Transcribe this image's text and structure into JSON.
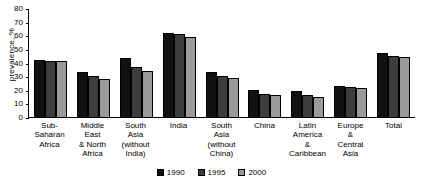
{
  "chart_data": {
    "type": "bar",
    "title": "",
    "xlabel": "",
    "ylabel": "prevalence, %",
    "ylim": [
      0,
      80
    ],
    "ytick_step": 10,
    "yticks": [
      80,
      70,
      60,
      50,
      40,
      30,
      20,
      10,
      0
    ],
    "grid": false,
    "legend_position": "bottom-center",
    "categories": [
      "Sub-Saharan\nAfrica",
      "Middle East\n& North\nAfrica",
      "South\nAsia\n(without\nIndia)",
      "India",
      "South\nAsia\n(without\nChina)",
      "China",
      "Latin\nAmerica\n&\nCaribbean",
      "Europe\n&\nCentral\nAsia",
      "Total"
    ],
    "series": [
      {
        "name": "1990",
        "color": "#111111",
        "values": [
          42,
          33,
          43,
          62,
          33,
          20,
          19,
          23,
          47
        ]
      },
      {
        "name": "1995",
        "color": "#3d3d3d",
        "values": [
          41,
          30,
          37,
          61,
          30,
          17,
          16,
          22,
          45
        ]
      },
      {
        "name": "2000",
        "color": "#9a9a9a",
        "values": [
          41,
          28,
          34,
          59,
          29,
          16,
          15,
          21,
          44
        ]
      }
    ]
  },
  "legend": {
    "items": [
      {
        "label": "1990"
      },
      {
        "label": "1995"
      },
      {
        "label": "2000"
      }
    ]
  }
}
